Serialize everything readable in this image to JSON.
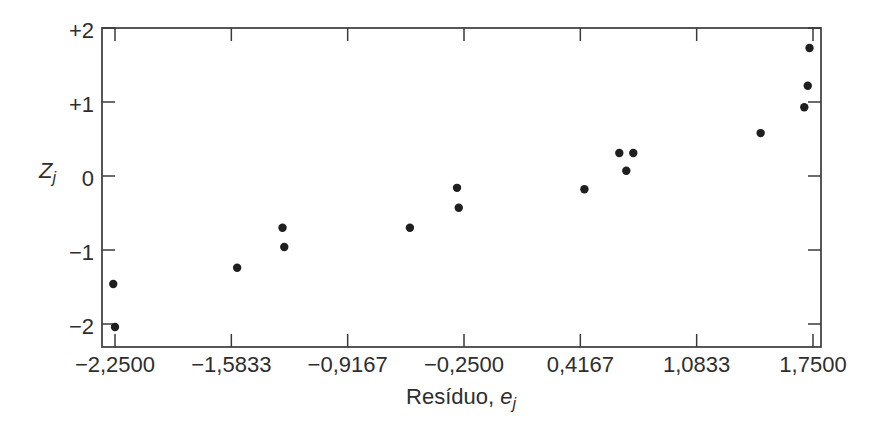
{
  "figure": {
    "background": "#ffffff",
    "text_color": "#2e2e2e",
    "axis_color": "#3a3a3a",
    "point_color": "#1f1f1f"
  },
  "axis_titles": {
    "y_var": "Z",
    "y_sub": "j",
    "x_text": "Resíduo, ",
    "x_var": "e",
    "x_sub": "j"
  },
  "chart_data": {
    "type": "scatter",
    "title": "",
    "xlabel": "Resíduo, e_j",
    "ylabel": "Z_j",
    "xlim": [
      -2.33,
      1.8
    ],
    "ylim": [
      -2.31,
      2.0
    ],
    "grid": false,
    "frame": "full-box",
    "tick_direction": "in",
    "legend": null,
    "xticks": [
      {
        "value": -2.25,
        "label": "−2,2500"
      },
      {
        "value": -1.5833,
        "label": "−1,5833"
      },
      {
        "value": -0.9167,
        "label": "−0,9167"
      },
      {
        "value": -0.25,
        "label": "−0,2500"
      },
      {
        "value": 0.4167,
        "label": "0,4167"
      },
      {
        "value": 1.0833,
        "label": "1,0833"
      },
      {
        "value": 1.75,
        "label": "1,7500"
      }
    ],
    "yticks": [
      {
        "value": 2,
        "label": "+2"
      },
      {
        "value": 1,
        "label": "+1"
      },
      {
        "value": 0,
        "label": "0"
      },
      {
        "value": -1,
        "label": "−1"
      },
      {
        "value": -2,
        "label": "−2"
      }
    ],
    "points": [
      [
        -2.26,
        -1.46
      ],
      [
        -2.25,
        -2.04
      ],
      [
        -1.55,
        -1.24
      ],
      [
        -1.29,
        -0.7
      ],
      [
        -1.28,
        -0.96
      ],
      [
        -0.56,
        -0.7
      ],
      [
        -0.29,
        -0.16
      ],
      [
        -0.28,
        -0.43
      ],
      [
        0.44,
        -0.18
      ],
      [
        0.64,
        0.31
      ],
      [
        0.72,
        0.31
      ],
      [
        0.68,
        0.07
      ],
      [
        1.45,
        0.58
      ],
      [
        1.7,
        0.93
      ],
      [
        1.72,
        1.22
      ],
      [
        1.73,
        1.73
      ]
    ]
  }
}
